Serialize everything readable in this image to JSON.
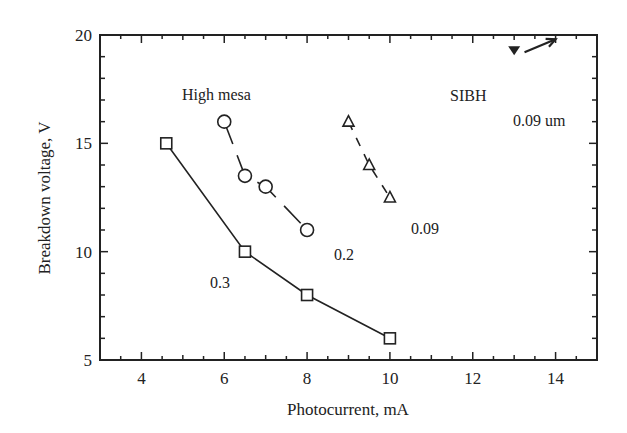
{
  "chart_data": {
    "type": "line",
    "title": "",
    "xlabel": "Photocurrent, mA",
    "ylabel": "Breakdown voltage, V",
    "xlim": [
      3,
      15
    ],
    "ylim": [
      5,
      20
    ],
    "xticks": [
      4,
      6,
      8,
      10,
      12,
      14
    ],
    "yticks": [
      5,
      10,
      15,
      20
    ],
    "grid": false,
    "legend": "none (inline annotations)",
    "series": [
      {
        "name": "High mesa 0.3",
        "marker": "open-square",
        "line": "solid",
        "x": [
          4.6,
          6.5,
          8.0,
          10.0
        ],
        "y": [
          15,
          10,
          8,
          6
        ]
      },
      {
        "name": "High mesa 0.2",
        "marker": "open-circle",
        "line": "long-dash",
        "x": [
          6.0,
          6.5,
          7.0,
          8.0
        ],
        "y": [
          16,
          13.5,
          13,
          11
        ]
      },
      {
        "name": "SIBH 0.09",
        "marker": "open-triangle",
        "line": "dashed",
        "x": [
          9.0,
          9.5,
          10.0
        ],
        "y": [
          16,
          14,
          12.5
        ]
      },
      {
        "name": "SIBH 0.09 um (off-scale)",
        "marker": "filled-down-triangle",
        "line": "none",
        "x": [
          13.0
        ],
        "y": [
          19.3
        ]
      }
    ],
    "annotations": [
      {
        "text": "High mesa",
        "x": 5.0,
        "y": 17.4
      },
      {
        "text": "SIBH",
        "x": 11.4,
        "y": 17.6
      },
      {
        "text": "0.09 um",
        "x": 13.0,
        "y": 16.4
      },
      {
        "text": "0.3",
        "x": 5.3,
        "y": 8.6
      },
      {
        "text": "0.2",
        "x": 8.4,
        "y": 9.8
      },
      {
        "text": "0.09",
        "x": 10.3,
        "y": 11.1
      },
      {
        "text": "arrow",
        "from": [
          13.25,
          19.2
        ],
        "to": [
          14.0,
          19.8
        ]
      }
    ]
  },
  "labels": {
    "xlabel": "Photocurrent, mA",
    "ylabel": "Breakdown voltage, V",
    "high_mesa": "High mesa",
    "sibh": "SIBH",
    "sibh_thickness": "0.09 um",
    "label_03": "0.3",
    "label_02": "0.2",
    "label_009": "0.09"
  }
}
